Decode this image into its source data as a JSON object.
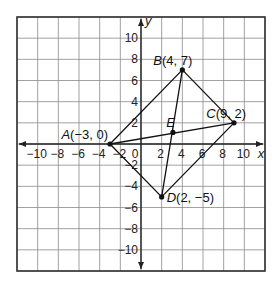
{
  "chart_data": {
    "type": "scatter",
    "title": "",
    "xlabel": "x",
    "ylabel": "y",
    "xlim": [
      -12,
      12
    ],
    "ylim": [
      -12,
      12
    ],
    "grid": true,
    "grid_step": 2,
    "x_tick_labels": [
      "-10",
      "-8",
      "-6",
      "-4",
      "-2",
      "0",
      "2",
      "4",
      "6",
      "8",
      "10"
    ],
    "x_tick_values": [
      -10,
      -8,
      -6,
      -4,
      -2,
      0,
      2,
      4,
      6,
      8,
      10
    ],
    "y_tick_labels": [
      "10",
      "8",
      "6",
      "4",
      "2",
      "-2",
      "-4",
      "-6",
      "-8",
      "-10"
    ],
    "y_tick_values": [
      10,
      8,
      6,
      4,
      2,
      -2,
      -4,
      -6,
      -8,
      -10
    ],
    "points": [
      {
        "name": "A",
        "x": -3,
        "y": 0,
        "label": "A",
        "coords": "(−3, 0)",
        "label_pos": "upper-left"
      },
      {
        "name": "B",
        "x": 4,
        "y": 7,
        "label": "B",
        "coords": "(4, 7)",
        "label_pos": "upper-left"
      },
      {
        "name": "C",
        "x": 9,
        "y": 2,
        "label": "C",
        "coords": "(9, 2)",
        "label_pos": "upper-left"
      },
      {
        "name": "D",
        "x": 2,
        "y": -5,
        "label": "D",
        "coords": "(2, −5)",
        "label_pos": "right"
      },
      {
        "name": "E",
        "x": 3.09,
        "y": 1.09,
        "label": "E",
        "coords": "",
        "label_pos": "upper-left"
      }
    ],
    "segments": [
      [
        "A",
        "B"
      ],
      [
        "B",
        "C"
      ],
      [
        "C",
        "D"
      ],
      [
        "D",
        "A"
      ],
      [
        "A",
        "C"
      ],
      [
        "B",
        "D"
      ]
    ]
  },
  "colors": {
    "grid": "#8a8a8a",
    "border": "#333333",
    "axis": "#222222",
    "line": "#111111"
  }
}
